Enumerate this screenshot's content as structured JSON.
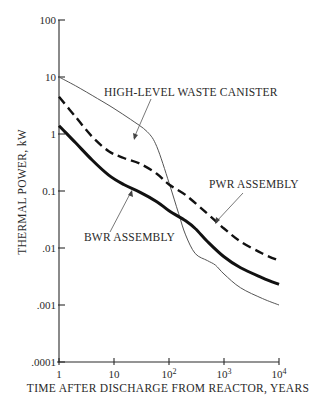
{
  "chart_data": {
    "type": "line",
    "title": "",
    "xlabel": "TIME AFTER DISCHARGE FROM REACTOR, YEARS",
    "ylabel": "THERMAL POWER, kW",
    "xscale": "log",
    "yscale": "log",
    "xlim": [
      1,
      10000
    ],
    "ylim": [
      0.0001,
      100
    ],
    "grid": false,
    "legend": "annotations with arrows",
    "x_ticks": [
      1,
      10,
      100,
      1000,
      10000
    ],
    "x_tick_labels": [
      {
        "base": "1",
        "exp": ""
      },
      {
        "base": "10",
        "exp": ""
      },
      {
        "base": "10",
        "exp": "2"
      },
      {
        "base": "10",
        "exp": "3"
      },
      {
        "base": "10",
        "exp": "4"
      }
    ],
    "y_ticks": [
      100,
      10,
      1,
      0.1,
      0.01,
      0.001,
      0.0001
    ],
    "y_tick_labels": [
      "100",
      "10",
      "1",
      "0.1",
      ".01",
      ".001",
      ".0001"
    ],
    "series": [
      {
        "name": "HIGH-LEVEL WASTE CANISTER",
        "style": "thin solid",
        "x": [
          1,
          2,
          5,
          10,
          20,
          40,
          60,
          100,
          150,
          200,
          300,
          500,
          700,
          1000,
          2000,
          5000,
          10000
        ],
        "y": [
          10,
          7,
          4.2,
          2.8,
          1.8,
          1.1,
          0.6,
          0.14,
          0.04,
          0.017,
          0.008,
          0.006,
          0.005,
          0.0035,
          0.002,
          0.0013,
          0.001
        ]
      },
      {
        "name": "PWR ASSEMBLY",
        "style": "thick dashed",
        "x": [
          1,
          2,
          4,
          8,
          15,
          30,
          60,
          100,
          200,
          500,
          1000,
          2000,
          5000,
          10000
        ],
        "y": [
          4.5,
          2.0,
          0.9,
          0.5,
          0.38,
          0.3,
          0.2,
          0.13,
          0.085,
          0.04,
          0.022,
          0.013,
          0.008,
          0.006
        ]
      },
      {
        "name": "BWR ASSEMBLY",
        "style": "extra-thick solid",
        "x": [
          1,
          2,
          4,
          8,
          15,
          30,
          60,
          100,
          200,
          300,
          500,
          1000,
          2000,
          5000,
          10000
        ],
        "y": [
          1.4,
          0.7,
          0.35,
          0.19,
          0.13,
          0.095,
          0.065,
          0.045,
          0.03,
          0.022,
          0.013,
          0.007,
          0.0045,
          0.003,
          0.0023
        ]
      }
    ],
    "annotations": [
      {
        "text": "HIGH-LEVEL WASTE CANISTER",
        "points_to": "HIGH-LEVEL WASTE CANISTER"
      },
      {
        "text": "PWR ASSEMBLY",
        "points_to": "PWR ASSEMBLY"
      },
      {
        "text": "BWR ASSEMBLY",
        "points_to": "BWR ASSEMBLY"
      }
    ]
  },
  "labels": {
    "hlw": "HIGH-LEVEL WASTE CANISTER",
    "pwr": "PWR ASSEMBLY",
    "bwr": "BWR ASSEMBLY",
    "xlabel": "TIME AFTER DISCHARGE FROM REACTOR, YEARS",
    "ylabel": "THERMAL POWER, kW"
  },
  "colors": {
    "ink": "#2a2a2a",
    "thin_line": "#555555",
    "background": "#ffffff"
  }
}
